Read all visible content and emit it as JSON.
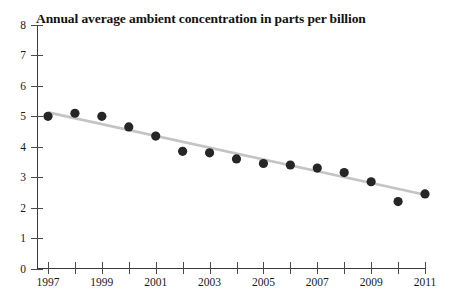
{
  "chart_data": {
    "type": "scatter",
    "title": "Annual average ambient concentration in parts per billion",
    "xlabel": "",
    "ylabel": "",
    "xlim": [
      1997,
      2011
    ],
    "ylim": [
      0,
      8
    ],
    "grid": false,
    "legend": null,
    "x": [
      1997,
      1998,
      1999,
      2000,
      2001,
      2002,
      2003,
      2004,
      2005,
      2006,
      2007,
      2008,
      2009,
      2010,
      2011
    ],
    "values": [
      5.0,
      5.1,
      5.0,
      4.65,
      4.35,
      3.85,
      3.8,
      3.6,
      3.45,
      3.4,
      3.3,
      3.15,
      2.85,
      2.2,
      2.45
    ],
    "series": [
      {
        "name": "Annual average ambient concentration",
        "type": "scatter",
        "marker_color": "#262626",
        "values": [
          5.0,
          5.1,
          5.0,
          4.65,
          4.35,
          3.85,
          3.8,
          3.6,
          3.45,
          3.4,
          3.3,
          3.15,
          2.85,
          2.2,
          2.45
        ]
      },
      {
        "name": "Linear trend",
        "type": "line",
        "line_color": "#c4c4c4",
        "endpoints": [
          {
            "x": 1997,
            "y": 5.13
          },
          {
            "x": 2011,
            "y": 2.42
          }
        ]
      }
    ],
    "y_ticks": [
      "0",
      "1",
      "2",
      "3",
      "4",
      "5",
      "6",
      "7",
      "8"
    ],
    "y_tick_values": [
      0,
      1,
      2,
      3,
      4,
      5,
      6,
      7,
      8
    ],
    "x_ticks_all": [
      1997,
      1998,
      1999,
      2000,
      2001,
      2002,
      2003,
      2004,
      2005,
      2006,
      2007,
      2008,
      2009,
      2010,
      2011
    ],
    "x_tick_labels": [
      {
        "value": 1997,
        "label": "1997"
      },
      {
        "value": 1999,
        "label": "1999"
      },
      {
        "value": 2001,
        "label": "2001"
      },
      {
        "value": 2003,
        "label": "2003"
      },
      {
        "value": 2005,
        "label": "2005"
      },
      {
        "value": 2007,
        "label": "2007"
      },
      {
        "value": 2009,
        "label": "2009"
      },
      {
        "value": 2011,
        "label": "2011"
      }
    ],
    "colors": {
      "marker": "#262626",
      "trend": "#c4c4c4",
      "axis": "#3a3a3a",
      "background": "#ffffff"
    }
  }
}
